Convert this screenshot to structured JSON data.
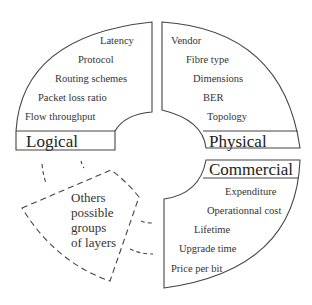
{
  "diagram": {
    "quadrants": [
      {
        "id": "logical",
        "title": "Logical",
        "items": [
          "Latency",
          "Protocol",
          "Routing schemes",
          "Packet loss ratio",
          "Flow throughput"
        ]
      },
      {
        "id": "physical",
        "title": "Physical",
        "items": [
          "Vendor",
          "Fibre type",
          "Dimensions",
          "BER",
          "Topology"
        ]
      },
      {
        "id": "commercial",
        "title": "Commercial",
        "items": [
          "Expenditure",
          "Operationnal cost",
          "Lifetime",
          "Upgrade time",
          "Price per bit"
        ]
      }
    ],
    "other": {
      "lines": [
        "Others",
        "possible",
        "groups",
        "of layers"
      ]
    },
    "colors": {
      "stroke": "#333333",
      "background": "#ffffff"
    }
  }
}
